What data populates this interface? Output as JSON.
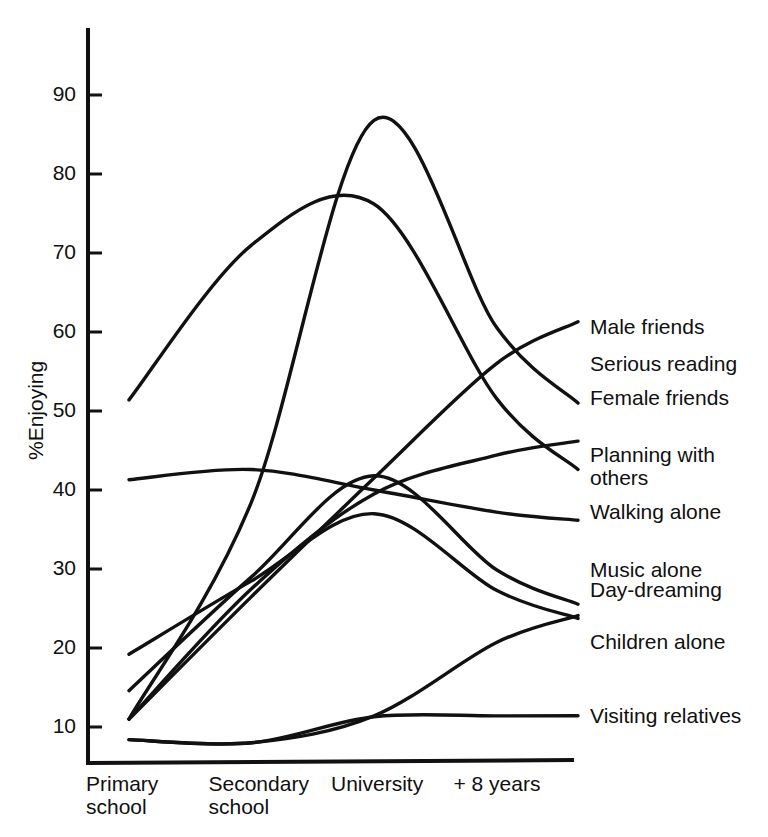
{
  "chart_data": {
    "type": "line",
    "title": "",
    "subtitle": "",
    "xlabel": "",
    "ylabel": "%Enjoying",
    "categories": [
      "Primary\nschool",
      "Secondary\nschool",
      "University",
      "+ 8 years"
    ],
    "category_labels_flat": [
      "Primary school",
      "Secondary school",
      "University",
      "+ 8 years"
    ],
    "x": [
      1,
      2,
      3,
      4
    ],
    "ylim": [
      5,
      95
    ],
    "xlim": [
      0.7,
      4.4
    ],
    "yticks": [
      10,
      20,
      30,
      40,
      50,
      60,
      70,
      80,
      90
    ],
    "ytick_labels": [
      "10",
      "20",
      "30",
      "40",
      "50",
      "60",
      "70",
      "80",
      "90"
    ],
    "grid": false,
    "legend_position": "right-inline-labels",
    "line_color": "#111111",
    "background_color": "#ffffff",
    "series": [
      {
        "name": "Male friends",
        "values": [
          11.0,
          38.5,
          86.8,
          60.6
        ],
        "label_y": 60.6
      },
      {
        "name": "Serious reading",
        "values": [
          11.0,
          26.5,
          41.5,
          56.0
        ],
        "label_y": 56.0
      },
      {
        "name": "Female friends",
        "values": [
          51.4,
          71.0,
          76.2,
          51.6
        ],
        "label_y": 51.6
      },
      {
        "name": "Planning with\nothers",
        "values": [
          11.0,
          27.5,
          39.5,
          44.4
        ],
        "label_y": 44.4
      },
      {
        "name": "Walking alone",
        "values": [
          41.3,
          42.6,
          40.0,
          37.2
        ],
        "label_y": 37.2
      },
      {
        "name": "Music alone",
        "values": [
          14.6,
          29.0,
          41.8,
          29.9
        ],
        "label_y": 29.9
      },
      {
        "name": "Day-dreaming",
        "values": [
          19.2,
          28.5,
          37.0,
          27.3
        ],
        "label_y": 27.3
      },
      {
        "name": "Children alone",
        "values": [
          8.4,
          8.0,
          11.4,
          20.7
        ],
        "label_y": 20.7
      },
      {
        "name": "Visiting relatives",
        "values": [
          8.4,
          8.0,
          11.3,
          11.4
        ],
        "label_y": 11.4
      }
    ]
  },
  "axis": {
    "y_title": "%Enjoying",
    "ticks": [
      "90",
      "80",
      "70",
      "60",
      "50",
      "40",
      "30",
      "20",
      "10"
    ]
  },
  "categories": [
    {
      "line1": "Primary",
      "line2": "school"
    },
    {
      "line1": "Secondary",
      "line2": "school"
    },
    {
      "line1": "University",
      "line2": ""
    },
    {
      "line1": "+ 8 years",
      "line2": ""
    }
  ],
  "series_labels": [
    {
      "name": "Male friends"
    },
    {
      "name": "Serious reading"
    },
    {
      "name": "Female friends"
    },
    {
      "name": "Planning with\nothers"
    },
    {
      "name": "Walking alone"
    },
    {
      "name": "Music alone"
    },
    {
      "name": "Day-dreaming"
    },
    {
      "name": "Children alone"
    },
    {
      "name": "Visiting relatives"
    }
  ]
}
